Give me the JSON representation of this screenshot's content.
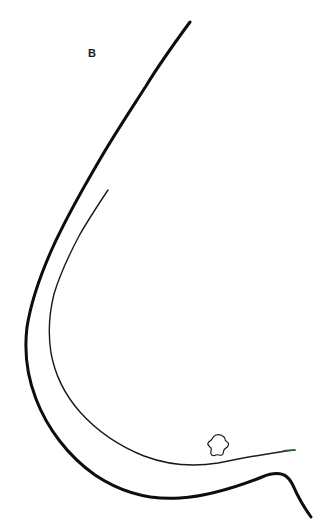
{
  "figure": {
    "panel_label": "B",
    "background_color": "#ffffff",
    "width": 334,
    "height": 525
  },
  "strokes": {
    "outer_contour": {
      "name": "outer-contour",
      "color": "#0d0d0d",
      "width": 3.0,
      "path": "M 190 22 C 176 41 160 63 146 86 C 130 111 114 135 99 161 C 82 190 66 218 52 249 C 40 276 31 302 27 327 C 24 352 27 376 36 399 C 47 428 68 456 95 475 C 122 493 152 500 180 498 C 210 496 239 486 262 477 C 272 473 281 472 287 477 C 292 481 294 488 297 494 C 301 502 306 510 311 517"
    },
    "inner_contour": {
      "name": "inner-contour",
      "color": "#1a1a1a",
      "width": 1.4,
      "path": "M 108 190 C 98 205 88 220 79 236 C 69 255 60 274 54 294 C 49 314 48 334 51 353 C 55 375 65 395 80 412 C 97 431 119 446 144 456 C 168 465 194 467 218 463 C 243 458 268 453 295 450"
    },
    "small_blob": {
      "name": "small-blob",
      "color": "#1a1a1a",
      "width": 1.2,
      "path": "M 216 435 C 219 434 222 435 224 437 C 226 438 224 440 226 441 C 228 442 229 444 228 446 C 227 448 225 448 224 450 C 223 452 224 454 222 455 C 220 456 218 454 216 455 C 214 456 212 456 211 454 C 210 452 212 450 211 448 C 209 446 207 445 208 443 C 209 441 211 441 212 439 C 213 437 214 436 216 435 Z"
    },
    "green_tip": {
      "name": "green-tip-highlight",
      "color": "#2f6b2f",
      "width": 1.4,
      "path": "M 283 451 C 287 450 291 450 295 450"
    }
  }
}
